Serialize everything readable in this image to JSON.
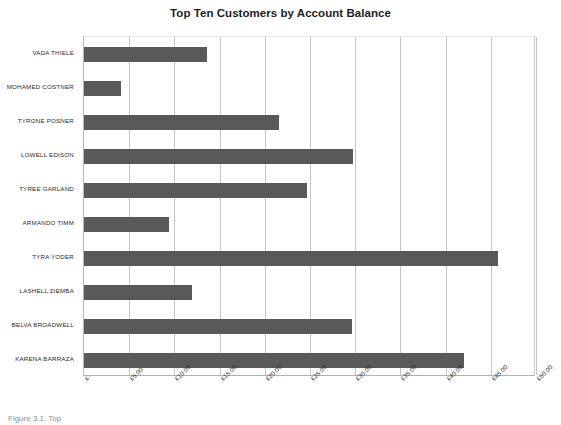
{
  "chart_data": {
    "type": "bar",
    "orientation": "horizontal",
    "title": "Top Ten Customers by Account Balance",
    "xlabel": "",
    "ylabel": "",
    "categories": [
      "VADA THIELE",
      "MOHAMED COSTNER",
      "TYRONE POSNER",
      "LOWELL EDISON",
      "TYREE GARLAND",
      "ARMANDO TIMM",
      "TYRA YODER",
      "LASHELL ZIEMBA",
      "BELVA BROADWELL",
      "KARENA BARRAZA"
    ],
    "values": [
      13.6,
      4.1,
      21.6,
      29.8,
      24.7,
      9.4,
      45.8,
      11.9,
      29.6,
      42.0
    ],
    "xlim": [
      0,
      50
    ],
    "xticks": [
      0,
      5,
      10,
      15,
      20,
      25,
      30,
      35,
      40,
      45,
      50
    ],
    "xtick_labels": [
      "£-",
      "£5.00",
      "£10.00",
      "£15.00",
      "£20.00",
      "£25.00",
      "£30.00",
      "£35.00",
      "£40.00",
      "£45.00",
      "£50.00"
    ],
    "grid": true,
    "grid_axis": "x",
    "legend": false,
    "bar_color": "#595959",
    "gridline_color": "#c4c4c4",
    "background_color": "#ffffff"
  },
  "caption": {
    "fragment": "Figure 3.1: Top"
  }
}
